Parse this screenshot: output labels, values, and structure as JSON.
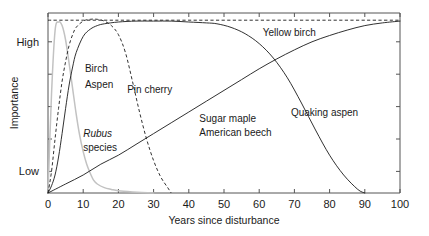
{
  "chart_data": {
    "type": "line",
    "title": "",
    "xlabel": "Years since disturbance",
    "ylabel": "Importance",
    "xlim": [
      0,
      100
    ],
    "ylim": [
      0,
      1
    ],
    "grid": false,
    "legend": "inline-annotations",
    "x_ticks": [
      "0",
      "10",
      "20",
      "30",
      "40",
      "50",
      "60",
      "70",
      "80",
      "90",
      "100"
    ],
    "x_tick_values": [
      0,
      10,
      20,
      30,
      40,
      50,
      60,
      70,
      80,
      90,
      100
    ],
    "y_ticks": [
      "Low",
      "High"
    ],
    "y_tick_values": [
      0.12,
      0.84
    ],
    "series": [
      {
        "name": "Rubus species",
        "style": "faint-gray",
        "x": [
          0,
          1,
          2,
          3,
          4,
          5,
          6,
          7,
          8,
          9,
          10,
          11,
          12,
          13,
          14,
          16,
          18,
          20,
          24,
          30
        ],
        "values": [
          0.0,
          0.55,
          0.9,
          0.95,
          0.93,
          0.85,
          0.72,
          0.58,
          0.44,
          0.32,
          0.23,
          0.16,
          0.11,
          0.07,
          0.05,
          0.03,
          0.02,
          0.012,
          0.006,
          0.0
        ]
      },
      {
        "name": "Pin cherry",
        "style": "dashed",
        "x": [
          0,
          1,
          2,
          3,
          4,
          5,
          6,
          7,
          8,
          10,
          12,
          14,
          16,
          18,
          20,
          22,
          24,
          26,
          28,
          30,
          32,
          34,
          35
        ],
        "values": [
          0.0,
          0.12,
          0.3,
          0.47,
          0.62,
          0.73,
          0.82,
          0.88,
          0.92,
          0.955,
          0.965,
          0.965,
          0.955,
          0.93,
          0.88,
          0.78,
          0.62,
          0.45,
          0.3,
          0.18,
          0.09,
          0.03,
          0.0
        ]
      },
      {
        "name": "Birch Aspen",
        "style": "solid",
        "x": [
          0,
          1,
          2,
          3,
          4,
          5,
          6,
          7,
          8,
          10,
          12,
          14,
          16,
          20,
          25,
          30,
          35,
          40,
          45,
          48,
          52,
          56,
          60,
          64,
          68,
          72,
          76,
          80,
          84,
          88,
          90
        ],
        "values": [
          0.0,
          0.04,
          0.1,
          0.2,
          0.33,
          0.47,
          0.6,
          0.7,
          0.78,
          0.87,
          0.91,
          0.93,
          0.94,
          0.95,
          0.955,
          0.955,
          0.955,
          0.95,
          0.945,
          0.94,
          0.92,
          0.885,
          0.83,
          0.75,
          0.64,
          0.5,
          0.35,
          0.21,
          0.1,
          0.02,
          0.0
        ]
      },
      {
        "name": "Yellow birch",
        "style": "dashed",
        "x": [
          0,
          5,
          10,
          20,
          30,
          40,
          50,
          60,
          70,
          80,
          90,
          100
        ],
        "values": [
          0.96,
          0.96,
          0.96,
          0.96,
          0.96,
          0.96,
          0.96,
          0.96,
          0.96,
          0.96,
          0.96,
          0.96
        ]
      },
      {
        "name": "Sugar maple American beech",
        "style": "solid",
        "x": [
          0,
          5,
          10,
          15,
          20,
          25,
          30,
          35,
          40,
          45,
          50,
          55,
          60,
          65,
          70,
          75,
          80,
          85,
          90,
          95,
          100
        ],
        "values": [
          0.0,
          0.05,
          0.1,
          0.16,
          0.21,
          0.27,
          0.33,
          0.39,
          0.45,
          0.51,
          0.57,
          0.63,
          0.69,
          0.745,
          0.795,
          0.84,
          0.875,
          0.905,
          0.93,
          0.945,
          0.955
        ]
      }
    ],
    "annotations": [
      {
        "text": "Birch",
        "series": "Birch Aspen",
        "x": 10.5,
        "y": 0.67
      },
      {
        "text": "Aspen",
        "series": "Birch Aspen",
        "x": 10.5,
        "y": 0.585
      },
      {
        "text": "Pin cherry",
        "series": "Pin cherry",
        "x": 22.5,
        "y": 0.555
      },
      {
        "text": "Rubus",
        "series": "Rubus species",
        "x": 10.0,
        "y": 0.31,
        "italic": true
      },
      {
        "text": "species",
        "series": "Rubus species",
        "x": 10.0,
        "y": 0.235
      },
      {
        "text": "Sugar maple",
        "series": "Sugar maple American beech",
        "x": 43.0,
        "y": 0.395
      },
      {
        "text": "American beech",
        "series": "Sugar maple American beech",
        "x": 43.0,
        "y": 0.315
      },
      {
        "text": "Yellow birch",
        "series": "Yellow birch",
        "x": 61.0,
        "y": 0.875
      },
      {
        "text": "Quaking aspen",
        "series": "Birch Aspen",
        "x": 69.0,
        "y": 0.43
      }
    ]
  }
}
